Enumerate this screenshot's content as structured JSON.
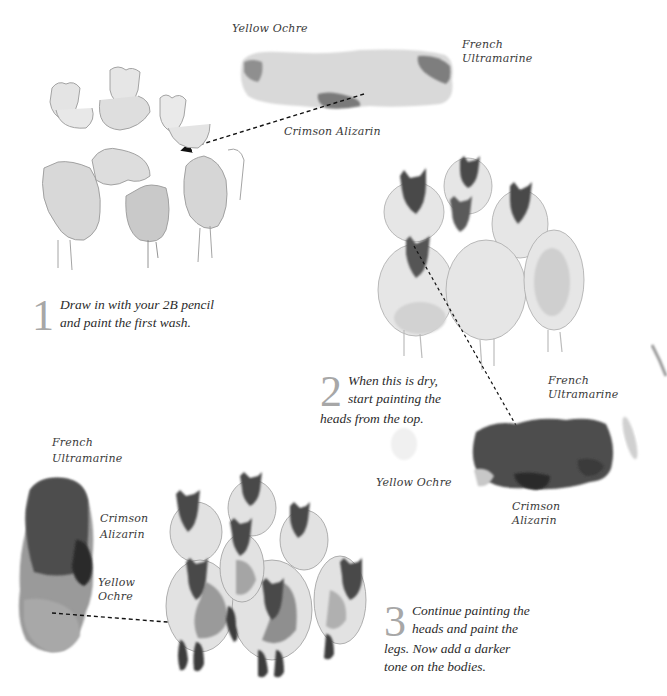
{
  "palette_top": {
    "labels": [
      "Yellow Ochre",
      "French\nUltramarine",
      "Crimson Alizarin"
    ],
    "yellow_ochre": "Yellow Ochre",
    "french_ultramarine_line1": "French",
    "french_ultramarine_line2": "Ultramarine",
    "crimson_alizarin": "Crimson Alizarin"
  },
  "palette_right": {
    "french_ultramarine_line1": "French",
    "french_ultramarine_line2": "Ultramarine",
    "yellow_ochre": "Yellow Ochre",
    "crimson_line1": "Crimson",
    "crimson_line2": "Alizarin"
  },
  "palette_left": {
    "french_ultramarine_line1": "French",
    "french_ultramarine_line2": "Ultramarine",
    "crimson_line1": "Crimson",
    "crimson_line2": "Alizarin",
    "yellow_line1": "Yellow",
    "yellow_line2": "Ochre"
  },
  "steps": [
    {
      "number": "1",
      "line1": "Draw in with your 2B pencil",
      "line2": "and paint the first wash."
    },
    {
      "number": "2",
      "line1": "When this is dry,",
      "line2": "start painting the",
      "line3": "heads from the top."
    },
    {
      "number": "3",
      "line1": "Continue painting the",
      "line2": "heads and paint the",
      "line3": "legs. Now add a darker",
      "line4": "tone on the bodies."
    }
  ],
  "colors": {
    "step_number": "#a7a7a7",
    "text": "#2b2b2b",
    "wash_light": "#d6d6d6",
    "wash_mid": "#8a8a8a",
    "wash_dark": "#444444"
  }
}
